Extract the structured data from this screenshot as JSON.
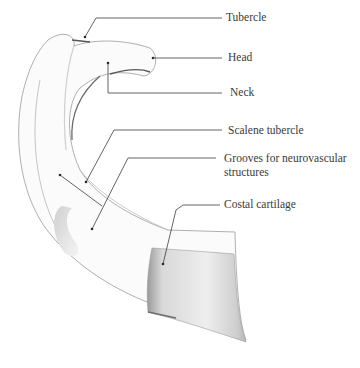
{
  "figure": {
    "labels": [
      {
        "id": "tubercle",
        "text": "Tubercle"
      },
      {
        "id": "head",
        "text": "Head"
      },
      {
        "id": "neck",
        "text": "Neck"
      },
      {
        "id": "scalene_tubercle",
        "text": "Scalene tubercle"
      },
      {
        "id": "grooves_line1",
        "text": "Grooves for neurovascular"
      },
      {
        "id": "grooves_line2",
        "text": "structures"
      },
      {
        "id": "costal_cartilage",
        "text": "Costal cartilage"
      }
    ]
  },
  "colors": {
    "leader_line": "#3c3c3c",
    "text": "#3a3a3a",
    "bone_outline": "#8a8a8a",
    "bone_fill": "#fafafa",
    "cartilage_shade": "#c9c9c9"
  }
}
